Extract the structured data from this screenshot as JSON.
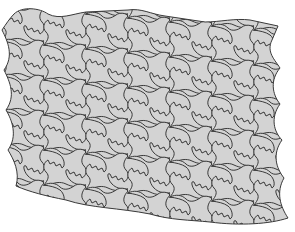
{
  "image": {
    "description": "Tessellation of interlocking puzzle-like tiles",
    "width": 295,
    "height": 232
  },
  "tessellation": {
    "columns": 7,
    "rows": 6,
    "tile_width": 42,
    "tile_height": 35,
    "row_shift_x": 0,
    "col_shift_y": 8,
    "colors": {
      "background": "#ffffff",
      "tile_fill": "#d3d3d3",
      "outline": "#3a3a3a"
    }
  }
}
